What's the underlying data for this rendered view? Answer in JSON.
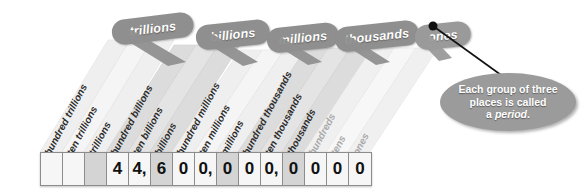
{
  "periods": [
    {
      "label": "trillions",
      "x": 118,
      "y": 22,
      "w": 76
    },
    {
      "label": "billions",
      "x": 200,
      "y": 27,
      "w": 68
    },
    {
      "label": "millions",
      "x": 271,
      "y": 30,
      "w": 70
    },
    {
      "label": "thousands",
      "x": 345,
      "y": 27,
      "w": 80
    },
    {
      "label": "ones",
      "x": 385,
      "y": 27,
      "w": 50
    }
  ],
  "places": [
    {
      "label": "hundred trillions",
      "faint": false
    },
    {
      "label": "ten trillions",
      "faint": false
    },
    {
      "label": "trillions",
      "faint": false
    },
    {
      "label": "hundred billions",
      "faint": false
    },
    {
      "label": "ten billions",
      "faint": false
    },
    {
      "label": "billions",
      "faint": false
    },
    {
      "label": "hundred millions",
      "faint": false
    },
    {
      "label": "ten millions",
      "faint": false
    },
    {
      "label": "millions",
      "faint": false
    },
    {
      "label": "hundred thousands",
      "faint": false
    },
    {
      "label": "ten thousands",
      "faint": false
    },
    {
      "label": "thousands",
      "faint": false
    },
    {
      "label": "hundreds",
      "faint": true
    },
    {
      "label": "tens",
      "faint": true
    },
    {
      "label": "ones",
      "faint": true
    }
  ],
  "number": {
    "formatted": "44,600,000,000,000",
    "digits": [
      "",
      "",
      "",
      "4",
      "4,",
      "6",
      "0",
      "0,",
      "0",
      "0",
      "0,",
      "0",
      "0",
      "0",
      ""
    ]
  },
  "digit_cells": [
    {
      "value": "",
      "shaded": false
    },
    {
      "value": "",
      "shaded": false
    },
    {
      "value": "",
      "shaded": true
    },
    {
      "value": "4",
      "shaded": false
    },
    {
      "value": "4,",
      "shaded": false
    },
    {
      "value": "6",
      "shaded": true
    },
    {
      "value": "0",
      "shaded": false
    },
    {
      "value": "0,",
      "shaded": false
    },
    {
      "value": "0",
      "shaded": true
    },
    {
      "value": "0",
      "shaded": false
    },
    {
      "value": "0,",
      "shaded": false
    },
    {
      "value": "0",
      "shaded": true
    },
    {
      "value": "0",
      "shaded": false
    },
    {
      "value": "0",
      "shaded": false
    },
    {
      "value": "0",
      "shaded": false
    }
  ],
  "callout": {
    "line1": "Each group of three",
    "line2": "places is called",
    "line3_prefix": "a ",
    "line3_em": "period",
    "line3_suffix": "."
  },
  "colors": {
    "tab_gray": "#8f8f8f",
    "callout_gray": "#9b9b9b",
    "band_light": "#f2f2f2",
    "band_dark": "#d9d9d9",
    "text_dark": "#2b2b2b",
    "text_faint": "#a9a9a9",
    "pointer": "#111111"
  }
}
